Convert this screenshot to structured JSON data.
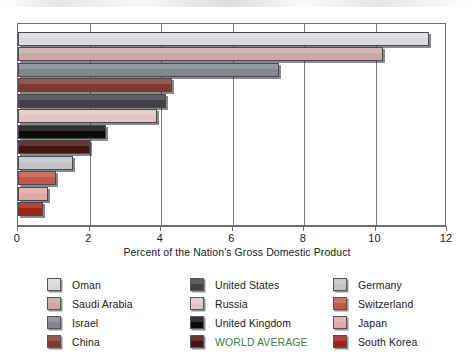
{
  "chart_data": {
    "type": "bar",
    "orientation": "horizontal",
    "title": "",
    "xlabel": "Percent of the Nation's Gross Domestic Product",
    "ylabel": "",
    "xlim": [
      0,
      12
    ],
    "xticks": [
      0,
      2,
      4,
      6,
      8,
      10,
      12
    ],
    "xtick_labels": [
      "0",
      "2",
      "4",
      "6",
      "8",
      "10",
      "12"
    ],
    "grid": true,
    "grid_axis": "x",
    "legend_position": "below",
    "legend_columns": 3,
    "categories": [
      "Oman",
      "Saudi Arabia",
      "Israel",
      "China",
      "United States",
      "Russia",
      "United Kingdom",
      "WORLD AVERAGE",
      "Germany",
      "Switzerland",
      "Japan",
      "South Korea"
    ],
    "values": [
      11.5,
      10.2,
      7.3,
      4.3,
      4.15,
      3.9,
      2.45,
      2.0,
      1.55,
      1.05,
      0.85,
      0.7
    ],
    "colors": [
      "#d9dadd",
      "#c9a9a8",
      "#83868b",
      "#7e3b33",
      "#3f4145",
      "#e0c7c5",
      "#0c0b0a",
      "#451310",
      "#c3c4c7",
      "#c2584b",
      "#e0a9a3",
      "#9c2318"
    ]
  },
  "axis": {
    "tick_labels": [
      "0",
      "2",
      "4",
      "6",
      "8",
      "10",
      "12"
    ],
    "title": "Percent of the Nation's Gross Domestic Product"
  },
  "legend": {
    "items": [
      {
        "label": "Oman",
        "color": "#d9dadd",
        "highlight": false
      },
      {
        "label": "Saudi Arabia",
        "color": "#c9a9a8",
        "highlight": false
      },
      {
        "label": "Israel",
        "color": "#83868b",
        "highlight": false
      },
      {
        "label": "China",
        "color": "#7e3b33",
        "highlight": false
      },
      {
        "label": "United States",
        "color": "#3f4145",
        "highlight": false
      },
      {
        "label": "Russia",
        "color": "#e0c7c5",
        "highlight": false
      },
      {
        "label": "United Kingdom",
        "color": "#0c0b0a",
        "highlight": false
      },
      {
        "label": "WORLD AVERAGE",
        "color": "#451310",
        "highlight": true
      },
      {
        "label": "Germany",
        "color": "#c3c4c7",
        "highlight": false
      },
      {
        "label": "Switzerland",
        "color": "#c2584b",
        "highlight": false
      },
      {
        "label": "Japan",
        "color": "#e0a9a3",
        "highlight": false
      },
      {
        "label": "South Korea",
        "color": "#9c2318",
        "highlight": false
      }
    ]
  }
}
